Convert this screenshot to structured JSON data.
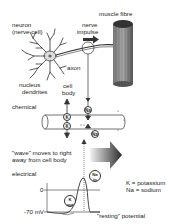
{
  "labels": {
    "neuron": "neuron",
    "nerve_cell": "(nerve cell)",
    "nerve_impulse_1": "nerve",
    "nerve_impulse_2": "impulse",
    "muscle_fibre": "muscle fibre",
    "axon": "axon",
    "nucleus": "nucleus",
    "dendrites": "dendrites",
    "cell_body_1": "cell",
    "cell_body_2": "body",
    "chemical": "chemical",
    "wave_1": "\"wave\" moves to right",
    "wave_2": "away from cell body",
    "electrical": "electrical",
    "zero": "0",
    "minus70": "-70 mV",
    "resting": "\"resting\" potential"
  },
  "legend": {
    "k": "K = potassium",
    "na": "Na = sodium"
  },
  "ions": {
    "k1": "K",
    "k2": "K",
    "na1": "Na",
    "na2": "Na",
    "na_in_1": "Na",
    "na_in_2": "in",
    "k_out_1": "K",
    "k_out_2": "out"
  },
  "colors": {
    "ink": "#222222",
    "background": "#ffffff",
    "muscle": "#555555",
    "arrow_gradient_start": "#f0f0f0",
    "arrow_gradient_end": "#333333"
  }
}
